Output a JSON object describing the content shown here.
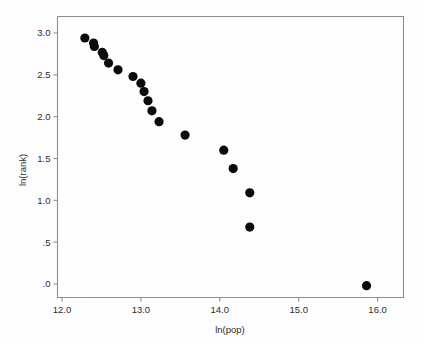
{
  "chart_data": {
    "type": "scatter",
    "title": "",
    "subtitle": "",
    "xlabel": "ln(pop)",
    "ylabel": "ln(rank)",
    "xlim": [
      11.82,
      16.21
    ],
    "ylim": [
      -0.12,
      3.18
    ],
    "grid": false,
    "legend": null,
    "legend_position": "none",
    "xticks": [
      "12.0",
      "13.0",
      "14.0",
      "15.0",
      "16.0"
    ],
    "xtick_values": [
      12.0,
      13.0,
      14.0,
      15.0,
      16.0
    ],
    "yticks": [
      "3.0",
      "2.5",
      "2.0",
      "1.5",
      "1.0",
      ".5",
      ".0"
    ],
    "ytick_values": [
      3.0,
      2.5,
      2.0,
      1.5,
      1.0,
      0.5,
      0.0
    ],
    "marker": "filled-circle",
    "marker_color": "#0b0b0b",
    "marker_size": 4.6,
    "n_points": 19,
    "x": [
      12.29,
      12.4,
      12.41,
      12.51,
      12.53,
      12.59,
      12.71,
      12.9,
      13.0,
      13.04,
      13.09,
      13.14,
      13.23,
      13.56,
      14.05,
      14.17,
      14.38,
      14.38,
      15.86
    ],
    "y": [
      2.94,
      2.88,
      2.84,
      2.77,
      2.73,
      2.64,
      2.56,
      2.48,
      2.4,
      2.3,
      2.19,
      2.07,
      1.94,
      1.78,
      1.6,
      1.38,
      1.09,
      0.68,
      -0.02
    ],
    "points": [
      {
        "x": 12.29,
        "y": 2.94
      },
      {
        "x": 12.4,
        "y": 2.88
      },
      {
        "x": 12.41,
        "y": 2.84
      },
      {
        "x": 12.51,
        "y": 2.77
      },
      {
        "x": 12.53,
        "y": 2.73
      },
      {
        "x": 12.59,
        "y": 2.64
      },
      {
        "x": 12.71,
        "y": 2.56
      },
      {
        "x": 12.9,
        "y": 2.48
      },
      {
        "x": 13.0,
        "y": 2.4
      },
      {
        "x": 13.04,
        "y": 2.3
      },
      {
        "x": 13.09,
        "y": 2.19
      },
      {
        "x": 13.14,
        "y": 2.07
      },
      {
        "x": 13.23,
        "y": 1.94
      },
      {
        "x": 13.56,
        "y": 1.78
      },
      {
        "x": 14.05,
        "y": 1.6
      },
      {
        "x": 14.17,
        "y": 1.38
      },
      {
        "x": 14.38,
        "y": 1.09
      },
      {
        "x": 14.38,
        "y": 0.68
      },
      {
        "x": 15.86,
        "y": -0.02
      }
    ],
    "annotations": []
  },
  "figure": {
    "background_color": "#fdfdfd",
    "frame_color": "#8d8d8d",
    "text_color": "#2b2b2b"
  }
}
